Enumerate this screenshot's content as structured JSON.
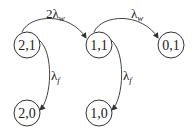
{
  "diagram": {
    "type": "state-transition",
    "nodes": [
      {
        "id": "n21",
        "label": "2,1",
        "cx": 27,
        "cy": 45
      },
      {
        "id": "n11",
        "label": "1,1",
        "cx": 99,
        "cy": 45
      },
      {
        "id": "n01",
        "label": "0,1",
        "cx": 171,
        "cy": 45
      },
      {
        "id": "n20",
        "label": "2,0",
        "cx": 27,
        "cy": 113
      },
      {
        "id": "n10",
        "label": "1,0",
        "cx": 99,
        "cy": 113
      }
    ],
    "edges": [
      {
        "from": "2,1",
        "to": "1,1",
        "label_prefix": "2",
        "label_symbol": "λ",
        "label_sub": "w"
      },
      {
        "from": "1,1",
        "to": "0,1",
        "label_prefix": "",
        "label_symbol": "λ",
        "label_sub": "w"
      },
      {
        "from": "2,1",
        "to": "2,0",
        "label_prefix": "",
        "label_symbol": "λ",
        "label_sub": "f"
      },
      {
        "from": "1,1",
        "to": "1,0",
        "label_prefix": "",
        "label_symbol": "λ",
        "label_sub": "f"
      }
    ],
    "colors": {
      "stroke": "#333333",
      "text": "#222222",
      "background": "#ffffff"
    }
  }
}
